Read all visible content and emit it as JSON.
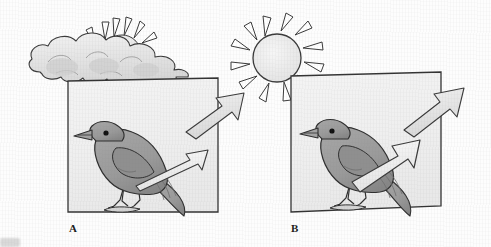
{
  "figure": {
    "type": "scientific-illustration",
    "background_color": "#fdfdfd",
    "ink_color": "#2b2b2b"
  },
  "panels": [
    {
      "id": "A",
      "label": "A",
      "sky": {
        "icon": "sun-behind-cloud-icon",
        "condition": "cloudy",
        "sun_visible": "partial",
        "ray_count": 6,
        "cloud_count": 1,
        "cloud_fill": "#e6e6e6",
        "cloud_shadow": "#c9c9c9"
      },
      "frame": {
        "x": 68,
        "y": 78,
        "width": 150,
        "height": 134,
        "fill": "#f0f0f0",
        "stroke": "#333333"
      },
      "bird": {
        "icon": "bird-icon",
        "species_style": "perching-songbird",
        "facing": "left",
        "body_fill": "#9a9a9a",
        "body_shadow": "#8a8a8a",
        "eye_color": "#101010",
        "perch": "branch"
      },
      "arrows": [
        {
          "name": "incident-radiation-arrow",
          "role": "incident",
          "direction": "up-right",
          "thickness": "wide",
          "fill": "#e2e2e2",
          "stroke": "#3a3a3a"
        },
        {
          "name": "reflected-radiation-arrow",
          "role": "reflected",
          "direction": "up-right",
          "thickness": "thin",
          "fill": "#f4f4f4",
          "stroke": "#3a3a3a"
        }
      ]
    },
    {
      "id": "B",
      "label": "B",
      "sky": {
        "icon": "sun-icon",
        "condition": "sunny",
        "sun_visible": "full",
        "ray_count": 12,
        "cloud_count": 0,
        "sun_fill": "#ededed",
        "sun_stroke": "#333333"
      },
      "frame": {
        "x": 291,
        "y": 72,
        "width": 150,
        "height": 140,
        "fill": "#f0f0f0",
        "stroke": "#333333"
      },
      "bird": {
        "icon": "bird-icon",
        "species_style": "perching-songbird",
        "facing": "left",
        "body_fill": "#9a9a9a",
        "body_shadow": "#8a8a8a",
        "eye_color": "#101010",
        "perch": "branch"
      },
      "arrows": [
        {
          "name": "incident-radiation-arrow",
          "role": "incident",
          "direction": "up-right",
          "thickness": "wide",
          "fill": "#e2e2e2",
          "stroke": "#3a3a3a"
        },
        {
          "name": "reflected-radiation-arrow",
          "role": "reflected",
          "direction": "up-right",
          "thickness": "wide",
          "fill": "#f4f4f4",
          "stroke": "#3a3a3a"
        }
      ]
    }
  ]
}
